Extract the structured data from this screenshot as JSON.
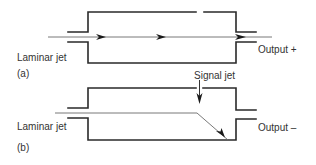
{
  "figure": {
    "panel_a": {
      "tag": "(a)",
      "input_label": "Laminar jet",
      "output_label": "Output +",
      "signal_label": "Signal jet"
    },
    "panel_b": {
      "tag": "(b)",
      "input_label": "Laminar jet",
      "output_label": "Output –"
    }
  },
  "colors": {
    "wall": "#2a2a2a",
    "jet": "#6a6a6a",
    "text": "#333333",
    "background": "#ffffff"
  }
}
